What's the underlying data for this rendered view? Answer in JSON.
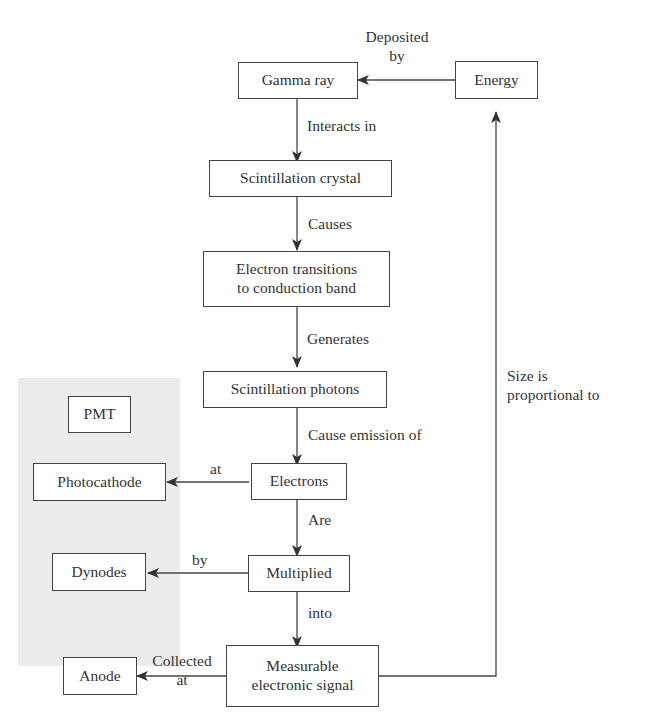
{
  "diagram": {
    "type": "flowchart",
    "group": {
      "label": "PMT",
      "background": "#ececec"
    },
    "nodes": {
      "gamma_ray": "Gamma ray",
      "energy": "Energy",
      "scint_crystal": "Scintillation crystal",
      "electron_transitions_line1": "Electron transitions",
      "electron_transitions_line2": "to conduction band",
      "scint_photons": "Scintillation photons",
      "pmt": "PMT",
      "electrons": "Electrons",
      "photocathode": "Photocathode",
      "multiplied": "Multiplied",
      "dynodes": "Dynodes",
      "signal_line1": "Measurable",
      "signal_line2": "electronic signal",
      "anode": "Anode"
    },
    "edges": {
      "energy_to_gamma_line1": "Deposited",
      "energy_to_gamma_line2": "by",
      "gamma_to_crystal": "Interacts in",
      "crystal_to_transitions": "Causes",
      "transitions_to_photons": "Generates",
      "photons_to_electrons": "Cause emission of",
      "electrons_to_photocathode": "at",
      "electrons_to_multiplied": "Are",
      "multiplied_to_dynodes": "by",
      "multiplied_to_signal": "into",
      "signal_to_anode_line1": "Collected",
      "signal_to_anode_line2": "at",
      "signal_to_energy_line1": "Size is",
      "signal_to_energy_line2": "proportional to"
    }
  }
}
